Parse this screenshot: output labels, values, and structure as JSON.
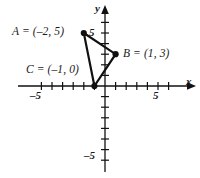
{
  "figure": {
    "type": "coordinate-plane-triangle",
    "background": "#ffffff",
    "ink_color": "#111111"
  },
  "axes": {
    "x_label": "x",
    "y_label": "y",
    "x_min": -6,
    "x_max": 6,
    "y_min": -6,
    "y_max": 6,
    "tick_step": 1,
    "tick_labels": {
      "x_neg": "–5",
      "x_pos": "5",
      "y_pos": "5",
      "y_neg": "–5"
    },
    "origin_px": {
      "x": 105,
      "y": 86
    },
    "unit_px": 10.6,
    "grid": false
  },
  "points": [
    {
      "id": "A",
      "label": "A = (–2, 5)",
      "x": -2,
      "y": 5,
      "label_pos": "left",
      "dot": true
    },
    {
      "id": "B",
      "label": "B = (1, 3)",
      "x": 1,
      "y": 3,
      "label_pos": "right",
      "dot": true
    },
    {
      "id": "C",
      "label": "C = (–1, 0)",
      "x": -1,
      "y": 0,
      "label_pos": "left",
      "dot": true
    }
  ],
  "shape": {
    "kind": "triangle",
    "vertices": [
      "A",
      "B",
      "C"
    ],
    "edges": [
      [
        "A",
        "B"
      ],
      [
        "B",
        "C"
      ],
      [
        "C",
        "A"
      ]
    ],
    "stroke": "#111111",
    "stroke_width": 2.2,
    "filled": false
  }
}
